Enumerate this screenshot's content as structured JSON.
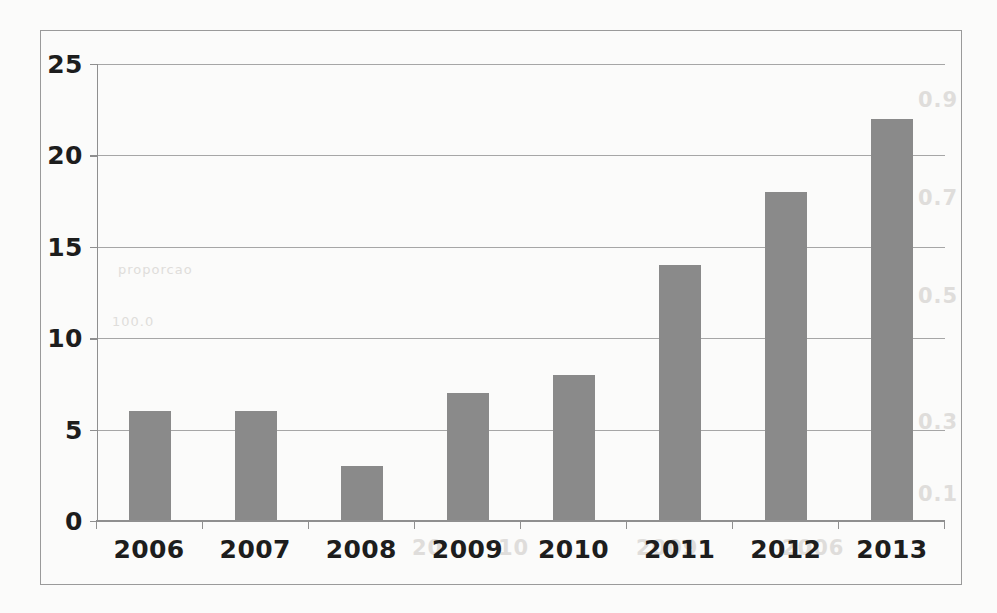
{
  "chart_data": {
    "type": "bar",
    "title": "",
    "subtitle": "",
    "xlabel": "",
    "ylabel": "",
    "categories": [
      "2006",
      "2007",
      "2008",
      "2009",
      "2010",
      "2011",
      "2012",
      "2013"
    ],
    "values": [
      6,
      6,
      3,
      7,
      8,
      14,
      18,
      22
    ],
    "ylim": [
      0,
      25
    ],
    "yticks": [
      0,
      5,
      10,
      15,
      20,
      25
    ],
    "ytick_labels": [
      "0",
      "5",
      "10",
      "15",
      "20",
      "25"
    ],
    "grid": true,
    "grid_axis": "y",
    "legend": false,
    "legend_position": "none",
    "series": [
      {
        "name": "",
        "values": [
          6,
          6,
          3,
          7,
          8,
          14,
          18,
          22
        ],
        "color": "#8a8a8a"
      }
    ],
    "annotations": []
  },
  "style": {
    "bar_color": "#8a8a8a",
    "grid_color": "#a6a6a6",
    "axis_color": "#8f8f8f",
    "frame_color": "#9a9a9a",
    "text_color": "#1d1d1d",
    "background": "#fbfbfa"
  },
  "background_artifacts": {
    "note": "faint show-through text from reverse of scanned page",
    "items": [
      {
        "text": "0.9",
        "x": 922,
        "y": 100
      },
      {
        "text": "0.7",
        "x": 922,
        "y": 198
      },
      {
        "text": "0.5",
        "x": 922,
        "y": 296
      },
      {
        "text": "0.3",
        "x": 922,
        "y": 420
      },
      {
        "text": "0.1",
        "x": 922,
        "y": 492
      },
      {
        "text": "proporcao",
        "x": 128,
        "y": 268
      },
      {
        "text": "100.0",
        "x": 120,
        "y": 320
      },
      {
        "text": "2009",
        "x": 646,
        "y": 546
      },
      {
        "text": "2006",
        "x": 790,
        "y": 546
      },
      {
        "text": "10",
        "x": 505,
        "y": 546
      },
      {
        "text": "20",
        "x": 420,
        "y": 546
      }
    ]
  }
}
